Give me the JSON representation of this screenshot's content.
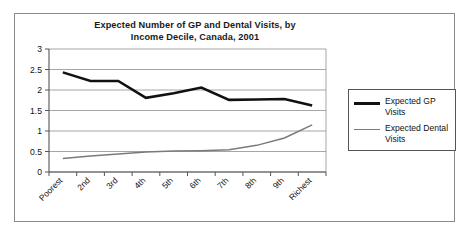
{
  "chart_data": {
    "type": "line",
    "title": "Expected Number of GP and Dental Visits, by Income Decile, Canada, 2001",
    "title_line1": "Expected Number of GP and Dental Visits, by",
    "title_line2": "Income Decile, Canada, 2001",
    "xlabel": "",
    "ylabel": "",
    "ylim": [
      0,
      3
    ],
    "yticks": [
      0,
      0.5,
      1,
      1.5,
      2,
      2.5,
      3
    ],
    "ytick_labels": [
      "0",
      "0.5",
      "1",
      "1.5",
      "2",
      "2.5",
      "3"
    ],
    "grid": true,
    "legend_position": "right",
    "categories": [
      "Poorest",
      "2nd",
      "3rd",
      "4th",
      "5th",
      "6th",
      "7th",
      "8th",
      "9th",
      "Richest"
    ],
    "series": [
      {
        "name": "Expected GP Visits",
        "color": "#111111",
        "values": [
          2.43,
          2.22,
          2.22,
          1.81,
          1.92,
          2.06,
          1.76,
          1.77,
          1.78,
          1.62
        ]
      },
      {
        "name": "Expected Dental Visits",
        "color": "#7a7a7a",
        "values": [
          0.33,
          0.39,
          0.44,
          0.49,
          0.51,
          0.52,
          0.54,
          0.65,
          0.83,
          1.15
        ]
      }
    ]
  },
  "legend": {
    "items": [
      {
        "label": "Expected GP Visits",
        "swatch": "gp-line-swatch"
      },
      {
        "label": "Expected Dental Visits",
        "swatch": "dental-line-swatch"
      }
    ]
  }
}
